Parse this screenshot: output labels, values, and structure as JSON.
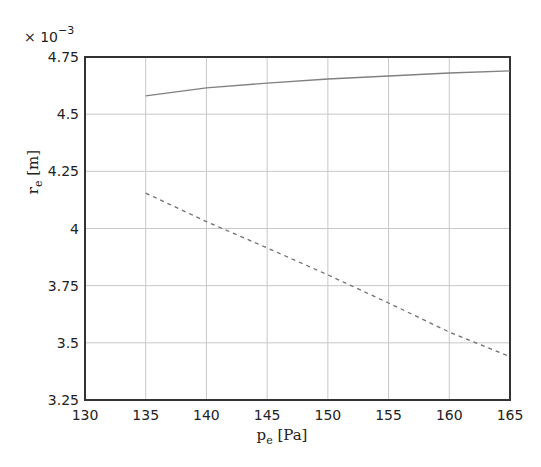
{
  "chart_data": {
    "type": "line",
    "title": "",
    "xlabel": "p_e [Pa]",
    "ylabel": "r_e [m]",
    "y_multiplier": "× 10^-3",
    "xlim": [
      130,
      165
    ],
    "ylim": [
      3.25,
      4.75
    ],
    "x_ticks": [
      130,
      135,
      140,
      145,
      150,
      155,
      160,
      165
    ],
    "y_ticks": [
      3.25,
      3.5,
      3.75,
      4,
      4.25,
      4.5,
      4.75
    ],
    "y_tick_labels": [
      "3.25",
      "3.5",
      "3.75",
      "4",
      "4.25",
      "4.5",
      "4.75"
    ],
    "grid": true,
    "legend": null,
    "x": [
      135,
      140,
      145,
      150,
      155,
      160,
      165
    ],
    "series": [
      {
        "name": "solid",
        "style": "solid",
        "color": "#808080",
        "values": [
          4.58,
          4.615,
          4.636,
          4.654,
          4.667,
          4.68,
          4.689
        ]
      },
      {
        "name": "dashed",
        "style": "dashed",
        "color": "#707070",
        "values": [
          4.155,
          4.03,
          3.915,
          3.797,
          3.674,
          3.547,
          3.44
        ]
      }
    ]
  },
  "labels": {
    "multiplier_base": "× 10",
    "multiplier_exp": "−3",
    "x_main": "p",
    "x_sub": "e",
    "x_unit": " [Pa]",
    "y_main": "r",
    "y_sub": "e",
    "y_unit": " [m]"
  }
}
